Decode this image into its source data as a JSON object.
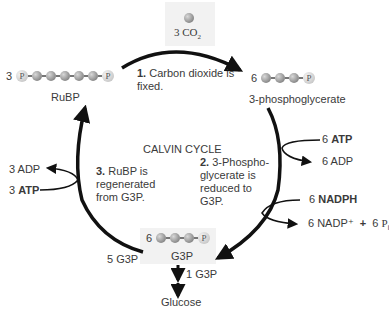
{
  "title": "CALVIN CYCLE",
  "co2": {
    "count": "3",
    "formula": "CO",
    "subscript": "2"
  },
  "steps": [
    {
      "num": "1.",
      "text": "Carbon dioxide is fixed."
    },
    {
      "num": "2.",
      "text": "3-Phospho-glycerate is reduced to G3P."
    },
    {
      "num": "3.",
      "text": "RuBP is regenerated from G3P."
    }
  ],
  "molecules": {
    "rubp": {
      "count": "3",
      "label": "RuBP",
      "p": "P"
    },
    "pga": {
      "count": "6",
      "label": "3-phosphoglycerate",
      "p": "P"
    },
    "g3p": {
      "count": "6",
      "label": "G3P",
      "p": "P"
    }
  },
  "inputs_outputs": {
    "atp_in_step2": {
      "count": "6",
      "name": "ATP"
    },
    "adp_out_step2": {
      "count": "6",
      "name": "ADP"
    },
    "nadph_in": {
      "count": "6",
      "name": "NADPH"
    },
    "nadp_out": "6 NADP⁺",
    "plus": "+",
    "pi_out": {
      "count": "6",
      "symbol": "P",
      "sub": "i"
    },
    "adp_out_step3": {
      "count": "3",
      "name": "ADP"
    },
    "atp_in_step3": {
      "count": "3",
      "name": "ATP"
    }
  },
  "outputs": {
    "recycled": "5 G3P",
    "exported": "1 G3P",
    "glucose": "Glucose"
  },
  "colors": {
    "arrow": "#111111",
    "text": "#3a3a3a",
    "box": "#f2f2f2"
  }
}
